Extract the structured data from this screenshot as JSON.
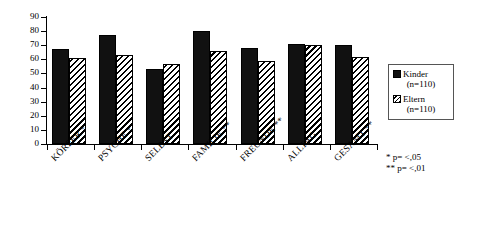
{
  "chart_data": {
    "type": "bar",
    "title": "",
    "subtitle": "",
    "xlabel": "",
    "ylabel": "",
    "ylim": [
      0,
      90
    ],
    "ytick_step": 10,
    "yticks": [
      90,
      80,
      70,
      60,
      50,
      40,
      30,
      20,
      10,
      0
    ],
    "grid": false,
    "legend_position": "right",
    "categories": [
      "KÖRPER *",
      "PSYCHE  *",
      "SELBST",
      "FAMILIE **",
      "FREUNDE **",
      "ALLTAG",
      "GESAMT **"
    ],
    "series": [
      {
        "name": "Kinder",
        "sublabel": "(n=110)",
        "pattern": "solid-black",
        "color": "#111111",
        "values": [
          67,
          77,
          53,
          80,
          68,
          71,
          70
        ]
      },
      {
        "name": "Eltern",
        "sublabel": "(n=110)",
        "pattern": "diagonal-hatch",
        "color": "#000000",
        "values": [
          61,
          63,
          57,
          66,
          59,
          70,
          62
        ]
      }
    ],
    "annotations": [
      "*  p= <,05",
      "** p= <,01"
    ]
  },
  "legend": {
    "entries": [
      {
        "label": "Kinder",
        "sublabel": "(n=110)"
      },
      {
        "label": "Eltern",
        "sublabel": "(n=110)"
      }
    ]
  },
  "significance": {
    "line1": "*  p= <,05",
    "line2": "** p= <,01"
  }
}
